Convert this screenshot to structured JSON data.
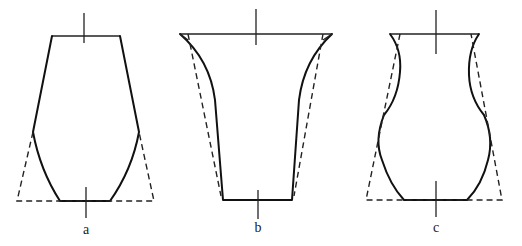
{
  "figure": {
    "background": "#ffffff",
    "line_color": "#111111",
    "panels": [
      {
        "id": "a",
        "label": "a",
        "label_pos": [
          86,
          234
        ],
        "axis_top": {
          "x": 84,
          "y1": 13,
          "y2": 43
        },
        "axis_bottom": {
          "x": 86,
          "y1": 187,
          "y2": 218
        },
        "rim": [
          [
            52,
            36
          ],
          [
            120,
            36
          ]
        ],
        "solid_profile": "M52,36 L33,132 Q40,170 60,201 L110,201 Q132,170 139,132 L120,36",
        "dashed_outline": "M33,132 L17,201 L154,201 L139,132"
      },
      {
        "id": "b",
        "label": "b",
        "label_pos": [
          258,
          232
        ],
        "axis_top": {
          "x": 256,
          "y1": 9,
          "y2": 45
        },
        "axis_bottom": {
          "x": 258,
          "y1": 190,
          "y2": 219
        },
        "rim": [
          [
            180,
            34
          ],
          [
            332,
            34
          ]
        ],
        "solid_profile": "M180,34 Q210,60 215,100 L223,200 L292,200 L299,100 Q304,60 332,34",
        "dashed_outline": "M188,34 L221,196 M323,34 L294,196",
        "rim_corner_lines": "M180,34 L188,40 M332,34 L323,40"
      },
      {
        "id": "c",
        "label": "c",
        "label_pos": [
          436,
          232
        ],
        "axis_top": {
          "x": 436,
          "y1": 10,
          "y2": 54
        },
        "axis_bottom": {
          "x": 436,
          "y1": 181,
          "y2": 217
        },
        "rim": [
          [
            390,
            34
          ],
          [
            479,
            34
          ]
        ],
        "solid_profile": "M390,34 Q402,50 400,72 Q398,98 384,115 Q374,140 382,160 Q390,185 404,200 L467,200 Q482,185 488,160 Q494,138 484,115 Q470,98 469,75 Q468,50 479,34",
        "dashed_outline": "M400,34 L366,200 L502,200 L471,34"
      }
    ]
  }
}
